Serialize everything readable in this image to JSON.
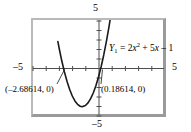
{
  "figure": {
    "kind": "graphing-calculator-viewport",
    "frame_color": "#9a9a9a",
    "curve_color": "#1a1a1a",
    "axis_color": "#4d4d4d",
    "background": "#ffffff"
  },
  "axes": {
    "top_label": "5",
    "bottom_label": "–5",
    "left_label": "–5",
    "right_label": "5"
  },
  "equation": {
    "name": "Y",
    "subscript": "1",
    "equals": "=",
    "term1_coeff": "2",
    "term1_var": "x",
    "term1_exp": "2",
    "plus": "+",
    "term2": "5",
    "term2_var": "x",
    "minus": "–",
    "constant": "1",
    "full_text": "Y₁ = 2x² + 5x – 1"
  },
  "annotations": {
    "intercept_left_label": "(–2.68614, 0)",
    "intercept_right_label": "(0.18614, 0)"
  },
  "chart_data": {
    "type": "line",
    "title": "",
    "xlabel": "",
    "ylabel": "",
    "xlim": [
      -5,
      5
    ],
    "ylim": [
      -5,
      5
    ],
    "grid": false,
    "legend_position": "inside-right",
    "xticks": [
      -5,
      -4,
      -3,
      -2,
      -1,
      0,
      1,
      2,
      3,
      4,
      5
    ],
    "yticks": [
      -5,
      -4,
      -3,
      -2,
      -1,
      0,
      1,
      2,
      3,
      4,
      5
    ],
    "xtick_labels": [
      "–5",
      "",
      "",
      "",
      "",
      "",
      "",
      "",
      "",
      "",
      "5"
    ],
    "ytick_labels": [
      "–5",
      "",
      "",
      "",
      "",
      "",
      "",
      "",
      "",
      "",
      "5"
    ],
    "series": [
      {
        "name": "Y₁ = 2x² + 5x – 1",
        "expression": "2*x^2 + 5*x - 1",
        "color": "#1a1a1a",
        "x": [
          -3.1,
          -3.0,
          -2.8,
          -2.6,
          -2.4,
          -2.2,
          -2.0,
          -1.8,
          -1.6,
          -1.4,
          -1.25,
          -1.0,
          -0.8,
          -0.6,
          -0.4,
          -0.2,
          0.0,
          0.2,
          0.4,
          0.6,
          0.8,
          1.0,
          1.2
        ],
        "y": [
          2.72,
          2.0,
          0.68,
          -0.48,
          -1.48,
          -2.32,
          -3.0,
          -3.52,
          -3.88,
          -4.08,
          -4.125,
          -4.0,
          -3.72,
          -3.28,
          -2.68,
          -1.92,
          -1.0,
          0.08,
          1.32,
          2.72,
          4.28,
          6.0,
          7.88
        ]
      }
    ],
    "annotated_points": [
      {
        "label": "(–2.68614, 0)",
        "x": -2.68614,
        "y": 0
      },
      {
        "label": "(0.18614, 0)",
        "x": 0.18614,
        "y": 0
      }
    ],
    "vertex": {
      "x": -1.25,
      "y": -4.125
    }
  }
}
